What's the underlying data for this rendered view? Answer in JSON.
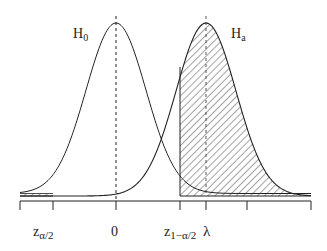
{
  "figure": {
    "curves": [
      {
        "id": "null",
        "label": "H",
        "subscript": "0",
        "mean_label": "0"
      },
      {
        "id": "alternative",
        "label": "H",
        "subscript": "a",
        "mean_label": "λ"
      }
    ],
    "axis_labels": [
      {
        "id": "z-alpha-half",
        "main": "z",
        "sub": "α/2"
      },
      {
        "id": "zero",
        "main": "0",
        "sub": ""
      },
      {
        "id": "z-one-minus-alpha-half",
        "main": "z",
        "sub": "1−α/2"
      },
      {
        "id": "lambda",
        "main": "λ",
        "sub": ""
      }
    ],
    "shaded_regions": [
      {
        "id": "left-rejection",
        "description": "Area under Ha left of z_{α/2} (hatched)"
      },
      {
        "id": "right-rejection",
        "description": "Area under Ha right of z_{1−α/2} (hatched, power)"
      }
    ],
    "colors": {
      "line": "#222222",
      "background": "#ffffff"
    }
  }
}
